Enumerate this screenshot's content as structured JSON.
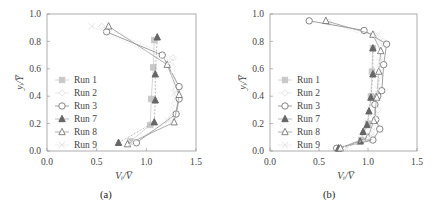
{
  "figure": {
    "captions": [
      "(a)",
      "(b)"
    ],
    "note": "Series values are approximate reconstructions of profile shapes; individual markers were not legible at source resolution."
  },
  "chart_data": [
    {
      "type": "scatter",
      "panel": "(a)",
      "xlabel": "Vᵢ/V̅",
      "ylabel": "yᵢ/Y̅",
      "xlim": [
        0.0,
        1.5
      ],
      "ylim": [
        0.0,
        1.0
      ],
      "xticks": [
        "0.0",
        "0.5",
        "1.0",
        "1.5"
      ],
      "yticks": [
        "0.0",
        "0.2",
        "0.4",
        "0.6",
        "0.8",
        "1.0"
      ],
      "grid": false,
      "legend": [
        "Run 1",
        "Run 2",
        "Run 3",
        "Run 7",
        "Run 8",
        "Run 9"
      ],
      "legend_position": "inside-left",
      "values_approximate": true,
      "series": [
        {
          "name": "Run 1",
          "marker": "square-filled",
          "color": "#c8c8c8",
          "line": "#cccccc",
          "x": [
            0.84,
            1.04,
            1.05,
            1.07,
            1.08
          ],
          "y": [
            0.07,
            0.19,
            0.38,
            0.61,
            0.81
          ]
        },
        {
          "name": "Run 2",
          "marker": "diamond-open",
          "color": "#e0e0e0",
          "line": "#e2e2e2",
          "x": [
            0.88,
            1.25,
            1.3,
            1.27,
            0.55
          ],
          "y": [
            0.06,
            0.24,
            0.45,
            0.68,
            0.91
          ]
        },
        {
          "name": "Run 3",
          "marker": "circle-open",
          "color": "#777777",
          "line": "#888888",
          "x": [
            0.9,
            1.3,
            1.33,
            1.33,
            1.16,
            0.6
          ],
          "y": [
            0.06,
            0.27,
            0.38,
            0.47,
            0.7,
            0.87
          ]
        },
        {
          "name": "Run 7",
          "marker": "triangle-filled",
          "color": "#666666",
          "line": "#aaaaaa",
          "x": [
            0.72,
            1.08,
            1.09,
            1.09,
            1.11
          ],
          "y": [
            0.06,
            0.21,
            0.37,
            0.56,
            0.83
          ]
        },
        {
          "name": "Run 8",
          "marker": "triangle-open",
          "color": "#777777",
          "line": "#999999",
          "x": [
            0.81,
            1.28,
            1.33,
            1.21,
            0.62
          ],
          "y": [
            0.05,
            0.21,
            0.41,
            0.63,
            0.91
          ]
        },
        {
          "name": "Run 9",
          "marker": "x-light",
          "color": "#e6e6e6",
          "line": "#e8e8e8",
          "x": [
            0.85,
            1.22,
            1.28,
            1.24,
            0.45
          ],
          "y": [
            0.06,
            0.22,
            0.42,
            0.65,
            0.91
          ]
        }
      ]
    },
    {
      "type": "scatter",
      "panel": "(b)",
      "xlabel": "Vᵢ/V̅",
      "ylabel": "yᵢ/Y̅",
      "xlim": [
        0.0,
        1.5
      ],
      "ylim": [
        0.0,
        1.0
      ],
      "xticks": [
        "0.0",
        "0.5",
        "1.0",
        "1.5"
      ],
      "yticks": [
        "0.0",
        "0.2",
        "0.4",
        "0.6",
        "0.8",
        "1.0"
      ],
      "grid": false,
      "legend": [
        "Run 1",
        "Run 2",
        "Run 3",
        "Run 7",
        "Run 8",
        "Run 9"
      ],
      "legend_position": "inside-left",
      "values_approximate": true,
      "series": [
        {
          "name": "Run 1",
          "marker": "square-filled",
          "color": "#c8c8c8",
          "line": "#cccccc",
          "x": [
            0.7,
            0.93,
            1.0,
            1.03,
            1.04,
            1.05
          ],
          "y": [
            0.02,
            0.08,
            0.2,
            0.4,
            0.58,
            0.75
          ]
        },
        {
          "name": "Run 2",
          "marker": "diamond-open",
          "color": "#e0e0e0",
          "line": "#e2e2e2",
          "x": [
            0.75,
            1.05,
            1.1,
            1.12,
            1.15,
            0.6
          ],
          "y": [
            0.02,
            0.1,
            0.3,
            0.55,
            0.8,
            0.94
          ]
        },
        {
          "name": "Run 3",
          "marker": "circle-open",
          "color": "#777777",
          "line": "#888888",
          "x": [
            0.68,
            1.05,
            1.12,
            1.08,
            1.07,
            1.1,
            1.14,
            1.16,
            1.19,
            0.96,
            0.4
          ],
          "y": [
            0.02,
            0.08,
            0.16,
            0.23,
            0.34,
            0.4,
            0.44,
            0.63,
            0.78,
            0.88,
            0.95
          ]
        },
        {
          "name": "Run 7",
          "marker": "triangle-filled",
          "color": "#666666",
          "line": "#aaaaaa",
          "x": [
            0.7,
            0.92,
            0.95,
            0.99,
            1.01,
            1.03,
            1.05,
            1.05
          ],
          "y": [
            0.02,
            0.07,
            0.14,
            0.19,
            0.29,
            0.39,
            0.56,
            0.75
          ]
        },
        {
          "name": "Run 8",
          "marker": "triangle-open",
          "color": "#777777",
          "line": "#999999",
          "x": [
            0.72,
            1.0,
            1.06,
            1.09,
            1.11,
            1.13,
            1.05,
            0.57
          ],
          "y": [
            0.02,
            0.1,
            0.22,
            0.39,
            0.58,
            0.73,
            0.85,
            0.95
          ]
        },
        {
          "name": "Run 9",
          "marker": "x-light",
          "color": "#e6e6e6",
          "line": "#e8e8e8",
          "x": [
            0.78,
            1.02,
            1.08,
            1.1,
            1.12,
            1.1
          ],
          "y": [
            0.02,
            0.1,
            0.25,
            0.45,
            0.65,
            0.85
          ]
        }
      ]
    }
  ]
}
